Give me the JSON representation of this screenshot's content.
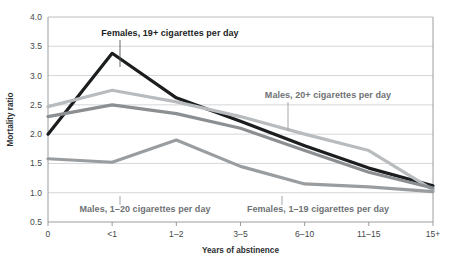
{
  "chart_data": {
    "type": "line",
    "title": "",
    "xlabel": "Years of abstinence",
    "ylabel": "Mortality ratio",
    "categories": [
      "0",
      "<1",
      "1–2",
      "3–5",
      "6–10",
      "11–15",
      "15+"
    ],
    "yticks": [
      "0.5",
      "1.0",
      "1.5",
      "2.0",
      "2.5",
      "3.0",
      "3.5",
      "4.0"
    ],
    "ylim": [
      0.5,
      4.0
    ],
    "grid": true,
    "legend_position": "inline-annotations",
    "series": [
      {
        "name": "Females, 19+ cigarettes per day",
        "color": "#1b1d1e",
        "width": 3.2,
        "values": [
          2.0,
          3.38,
          2.62,
          2.22,
          1.8,
          1.42,
          1.12
        ]
      },
      {
        "name": "Males, 20+ cigarettes per day",
        "color": "#b9bcbe",
        "width": 3.2,
        "values": [
          2.47,
          2.75,
          2.55,
          2.3,
          2.0,
          1.72,
          1.05
        ]
      },
      {
        "name": "Females, 1–19 cigarettes per day",
        "color": "#8b8f92",
        "width": 3.2,
        "values": [
          2.3,
          2.5,
          2.35,
          2.1,
          1.72,
          1.35,
          1.08
        ]
      },
      {
        "name": "Males, 1–20 cigarettes per day",
        "color": "#9a9d9f",
        "width": 3.2,
        "values": [
          1.58,
          1.52,
          1.9,
          1.45,
          1.15,
          1.1,
          1.02
        ]
      }
    ],
    "annotations": [
      {
        "id": "annot-females-19plus",
        "text": "Females, 19+ cigarettes per day",
        "style": "dark",
        "text_x": 170,
        "text_y": 36,
        "anchor": "middle",
        "leader_x": 120,
        "leader_y1": 40,
        "leader_y2": 67
      },
      {
        "id": "annot-males-20plus",
        "text": "Males, 20+ cigarettes per day",
        "style": "gray",
        "text_x": 328,
        "text_y": 98,
        "anchor": "middle",
        "leader_x": 288,
        "leader_y1": 102,
        "leader_y2": 131
      },
      {
        "id": "annot-males-1to20",
        "text": "Males, 1–20 cigarettes per day",
        "style": "gray",
        "text_x": 145,
        "text_y": 212,
        "anchor": "middle",
        "leader_x": 120,
        "leader_y1": 196,
        "leader_y2": 205
      },
      {
        "id": "annot-females-1to19",
        "text": "Females, 1–19 cigarettes per day",
        "style": "gray",
        "text_x": 318,
        "text_y": 212,
        "anchor": "middle",
        "leader_x": 282,
        "leader_y1": 196,
        "leader_y2": 205
      }
    ]
  },
  "layout": {
    "plot_left": 48,
    "plot_right": 433,
    "plot_top": 17,
    "plot_bottom": 222
  }
}
